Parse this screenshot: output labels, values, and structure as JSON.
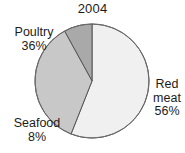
{
  "figure": {
    "title": "2004",
    "background_color": "#ffffff"
  },
  "labels": {
    "poultry": {
      "name": "Poultry",
      "percent": "36%"
    },
    "seafood": {
      "name": "Seafood",
      "percent": "8%"
    },
    "red_meat": {
      "name_line1": "Red",
      "name_line2": "meat",
      "percent": "56%"
    }
  },
  "chart_data": {
    "type": "pie",
    "title": "2004",
    "subtitle": "",
    "xlabel": "",
    "ylabel": "",
    "categories": [
      "Red meat",
      "Poultry",
      "Seafood"
    ],
    "values": [
      56,
      36,
      8
    ],
    "value_unit": "percent",
    "total": 100,
    "start_angle_deg": 0,
    "direction": "clockwise",
    "legend": "none",
    "labels_position": "outside",
    "grid": false,
    "slices": [
      {
        "label": "Red meat",
        "value": 56,
        "display": "56%",
        "color": "#f0f0f0",
        "start_deg": 0,
        "end_deg": 201.6,
        "label_anchor": "right"
      },
      {
        "label": "Poultry",
        "value": 36,
        "display": "36%",
        "color": "#c8c8c8",
        "start_deg": 230.4,
        "end_deg": 360,
        "label_anchor": "left"
      },
      {
        "label": "Seafood",
        "value": 8,
        "display": "8%",
        "color": "#a9a9a9",
        "start_deg": 201.6,
        "end_deg": 230.4,
        "label_anchor": "bottom-left"
      }
    ],
    "outline_color": "#555555"
  }
}
